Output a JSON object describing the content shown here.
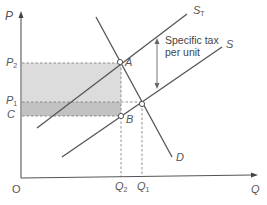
{
  "diagram": {
    "type": "supply-demand-tax-incidence",
    "axes": {
      "y_label": "P",
      "x_label": "Q",
      "origin_label": "O"
    },
    "price_labels": {
      "p2": {
        "main": "P",
        "sub": "2"
      },
      "p1": {
        "main": "P",
        "sub": "1"
      },
      "c": "C"
    },
    "quantity_labels": {
      "q2": {
        "main": "Q",
        "sub": "2"
      },
      "q1": {
        "main": "Q",
        "sub": "1"
      }
    },
    "curves": {
      "st": {
        "main": "S",
        "sub": "T"
      },
      "s": "S",
      "d": "D"
    },
    "points": {
      "a": "A",
      "b": "B"
    },
    "annotation": {
      "line1": "Specific tax",
      "line2": "per unit"
    },
    "colors": {
      "line": "#555555",
      "consumer_burden_fill": "#d9d9d9",
      "producer_burden_fill": "#bdbdbd",
      "text": "#555555"
    }
  }
}
